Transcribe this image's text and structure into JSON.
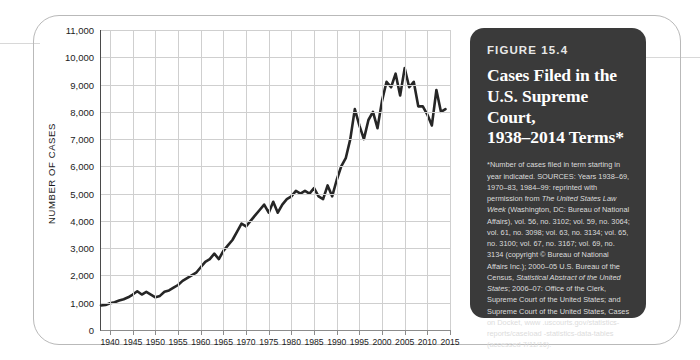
{
  "figure": {
    "number": "FIGURE 15.4",
    "title_lines": [
      "Cases Filed in the",
      "U.S. Supreme Court,",
      "1938–2014 Terms*"
    ],
    "note": "*Number of cases filed in term starting in year indicated.",
    "sources_prefix": "SOURCES: Years 1938–69, 1970–83, 1984–99: reprinted with permission from ",
    "sources_italic_1": "The United States Law Week",
    "sources_mid": " (Washington, DC: Bureau of National Affairs), vol. 56, no. 3102; vol. 59, no. 3064; vol. 61, no. 3098; vol. 63, no. 3134; vol. 65, no. 3100; vol. 67, no. 3167; vol. 69, no. 3134 (copyright © Bureau of National Affairs Inc.); 2000–05 U.S. Bureau of the Census, ",
    "sources_italic_2": "Statistical Abstract of the United States",
    "sources_suffix": "; 2006–07: Office of the Clerk, Supreme Court of the United States; and Supreme Court of the United States, Cases on Docket, www .uscourts.gov/statistics-reports/caseload -statistics-data-tables (accessed 7/11/16).",
    "panel_color": "#3a3a3a"
  },
  "chart_data": {
    "type": "line",
    "title": "Cases Filed in the U.S. Supreme Court, 1938–2014 Terms",
    "xlabel": "",
    "ylabel": "NUMBER OF CASES",
    "xlim": [
      1938,
      2015
    ],
    "ylim": [
      0,
      11000
    ],
    "grid": true,
    "legend": "none",
    "line_color": "#262626",
    "y_ticks": [
      0,
      1000,
      2000,
      3000,
      4000,
      5000,
      6000,
      7000,
      8000,
      9000,
      10000,
      11000
    ],
    "y_tick_labels": [
      "0",
      "1,000",
      "2,000",
      "3,000",
      "4,000",
      "5,000",
      "6,000",
      "7,000",
      "8,000",
      "9,000",
      "10,000",
      "11,000"
    ],
    "x_ticks": [
      1940,
      1945,
      1950,
      1955,
      1960,
      1965,
      1970,
      1975,
      1980,
      1985,
      1990,
      1995,
      2000,
      2005,
      2010,
      2015
    ],
    "x_tick_labels": [
      "1940",
      "1945",
      "1950",
      "1955",
      "1960",
      "1965",
      "1970",
      "1975",
      "1980",
      "1985",
      "1990",
      "1995",
      "2000",
      "2005",
      "2010",
      "2015"
    ],
    "x": [
      1938,
      1939,
      1940,
      1941,
      1942,
      1943,
      1944,
      1945,
      1946,
      1947,
      1948,
      1949,
      1950,
      1951,
      1952,
      1953,
      1954,
      1955,
      1956,
      1957,
      1958,
      1959,
      1960,
      1961,
      1962,
      1963,
      1964,
      1965,
      1966,
      1967,
      1968,
      1969,
      1970,
      1971,
      1972,
      1973,
      1974,
      1975,
      1976,
      1977,
      1978,
      1979,
      1980,
      1981,
      1982,
      1983,
      1984,
      1985,
      1986,
      1987,
      1988,
      1989,
      1990,
      1991,
      1992,
      1993,
      1994,
      1995,
      1996,
      1997,
      1998,
      1999,
      2000,
      2001,
      2002,
      2003,
      2004,
      2005,
      2006,
      2007,
      2008,
      2009,
      2010,
      2011,
      2012,
      2013,
      2014
    ],
    "y": [
      900,
      920,
      980,
      1020,
      1080,
      1130,
      1200,
      1300,
      1420,
      1300,
      1400,
      1300,
      1200,
      1250,
      1400,
      1450,
      1550,
      1650,
      1800,
      1900,
      2000,
      2100,
      2300,
      2500,
      2600,
      2800,
      2600,
      2900,
      3100,
      3300,
      3600,
      3900,
      3800,
      4000,
      4200,
      4400,
      4600,
      4300,
      4700,
      4300,
      4600,
      4800,
      4900,
      5100,
      5000,
      5100,
      5000,
      5200,
      4900,
      4800,
      5300,
      4900,
      5500,
      6000,
      6300,
      7000,
      8100,
      7500,
      7000,
      7700,
      8000,
      7400,
      8400,
      9100,
      8900,
      9400,
      8600,
      9600,
      8900,
      9100,
      8200,
      8200,
      7900,
      7500,
      8800,
      8000,
      8100
    ],
    "source_note_years": "1938–2014"
  }
}
